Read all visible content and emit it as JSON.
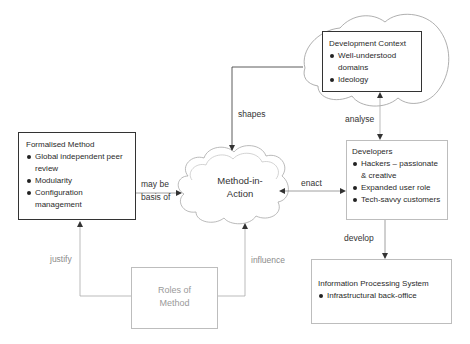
{
  "diagram": {
    "nodes": {
      "formalised_method": {
        "title": "Formalised Method",
        "bullets": [
          "Global independent peer review",
          "Modularity",
          "Configuration management"
        ]
      },
      "method_in_action": {
        "label_line1": "Method-in-",
        "label_line2": "Action"
      },
      "development_context": {
        "title": "Development Context",
        "bullets": [
          "Well-understood domains",
          "Ideology"
        ]
      },
      "developers": {
        "title": "Developers",
        "bullets": [
          "Hackers – passionate & creative",
          "Expanded user role",
          "Tech-savvy customers"
        ]
      },
      "information_processing_system": {
        "title": "Information Processing System",
        "bullets": [
          "Infrastructural back-office"
        ]
      },
      "roles_of_method": {
        "label_line1": "Roles of",
        "label_line2": "Method"
      }
    },
    "edges": {
      "shapes": "shapes",
      "analyse": "analyse",
      "may_be_basis_of_line1": "may be",
      "may_be_basis_of_line2": "basis of",
      "enact": "enact",
      "develop": "develop",
      "justify": "justify",
      "influence": "influence"
    },
    "colors": {
      "dark_line": "#333333",
      "light_line": "#b5b5b5",
      "gray_text": "#8c8c8c"
    }
  }
}
